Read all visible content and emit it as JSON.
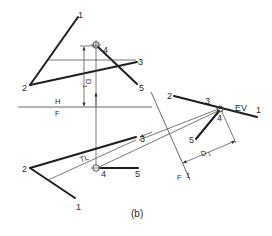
{
  "figure": {
    "caption": "(b)",
    "colors": {
      "line": "#1e1e1e",
      "thin": "#555555",
      "background": "#ffffff"
    }
  },
  "top_view": {
    "points": {
      "p1": "1",
      "p2": "2",
      "p3": "3",
      "p4": "4",
      "p5": "5"
    },
    "dimension_label": "D",
    "dimension_sub": "1"
  },
  "fold_lines": {
    "hf_top": "H",
    "hf_bottom": "F",
    "f1_left": "F",
    "f1_right": "1"
  },
  "front_view": {
    "points": {
      "p1": "1",
      "p2": "2",
      "p3": "3",
      "p4": "4",
      "p5": "5"
    },
    "true_length_label": "TL"
  },
  "auxiliary_view": {
    "points": {
      "p1": "1",
      "p2": "2",
      "p3": "3",
      "p4": "4",
      "p5": "5"
    },
    "edge_view_label": "EV",
    "dimension_label": "D",
    "dimension_sub": "1"
  }
}
